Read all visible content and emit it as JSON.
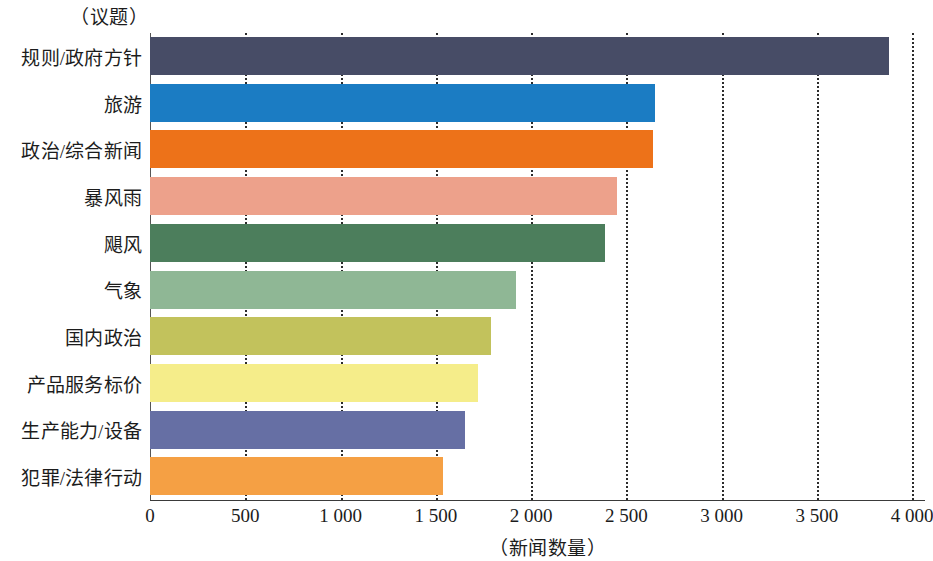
{
  "chart_data": {
    "type": "bar",
    "orientation": "horizontal",
    "title": "（议题）",
    "xlabel": "（新闻数量）",
    "ylabel": "",
    "xlim": [
      0,
      4000
    ],
    "xticks": [
      0,
      500,
      1000,
      1500,
      2000,
      2500,
      3000,
      3500,
      4000
    ],
    "xtick_labels": [
      "0",
      "500",
      "1 000",
      "1 500",
      "2 000",
      "2 500",
      "3 000",
      "3 500",
      "4 000"
    ],
    "grid": "vertical-dotted",
    "legend": "none",
    "categories": [
      "规则/政府方针",
      "旅游",
      "政治/综合新闻",
      "暴风雨",
      "飓风",
      "气象",
      "国内政治",
      "产品服务标价",
      "生产能力/设备",
      "犯罪/法律行动"
    ],
    "values": [
      3880,
      2650,
      2640,
      2450,
      2390,
      1920,
      1790,
      1720,
      1655,
      1540
    ],
    "colors": [
      "#474c66",
      "#1b7cc3",
      "#ed7219",
      "#eda18b",
      "#4c7e5c",
      "#8fb795",
      "#c2c25c",
      "#f5ed8a",
      "#666fa4",
      "#f5a044"
    ],
    "bars": [
      {
        "category": "规则/政府方针",
        "value": 3880,
        "color": "#474c66"
      },
      {
        "category": "旅游",
        "value": 2650,
        "color": "#1b7cc3"
      },
      {
        "category": "政治/综合新闻",
        "value": 2640,
        "color": "#ed7219"
      },
      {
        "category": "暴风雨",
        "value": 2450,
        "color": "#eda18b"
      },
      {
        "category": "飓风",
        "value": 2390,
        "color": "#4c7e5c"
      },
      {
        "category": "气象",
        "value": 1920,
        "color": "#8fb795"
      },
      {
        "category": "国内政治",
        "value": 1790,
        "color": "#c2c25c"
      },
      {
        "category": "产品服务标价",
        "value": 1720,
        "color": "#f5ed8a"
      },
      {
        "category": "生产能力/设备",
        "value": 1655,
        "color": "#666fa4"
      },
      {
        "category": "犯罪/法律行动",
        "value": 1540,
        "color": "#f5a044"
      }
    ]
  }
}
